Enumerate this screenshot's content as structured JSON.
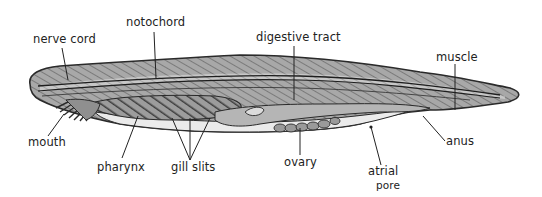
{
  "labels": {
    "nerve_cord": "nerve cord",
    "notochord": "notochord",
    "digestive_tract": "digestive tract",
    "muscle": "muscle",
    "mouth": "mouth",
    "pharynx": "pharynx",
    "gill_slits": "gill slits",
    "ovary": "ovary",
    "atrial_pore_line1": "atrial",
    "atrial_pore_line2": "pore",
    "anus": "anus"
  },
  "colors": {
    "outline": "#2a2a2a",
    "body_fill": "#9a9a9a",
    "body_light": "#c9c9c9",
    "belly": "#e8e8e8",
    "pharynx_fill": "#8a8a8a",
    "text": "#222222"
  }
}
